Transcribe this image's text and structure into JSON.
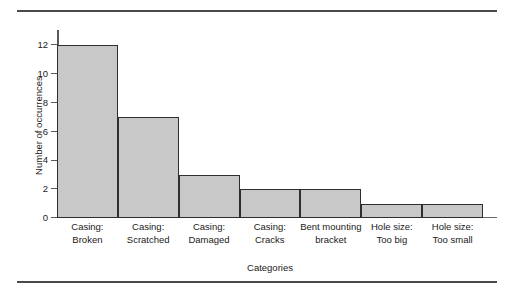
{
  "chart_data": {
    "type": "bar",
    "title": "",
    "subtitle": "",
    "xlabel": "Categories",
    "ylabel": "Number of occurrences",
    "categories": [
      "Casing: Broken",
      "Casing: Scratched",
      "Casing: Damaged",
      "Casing: Cracks",
      "Bent mounting bracket",
      "Hole size: Too big",
      "Hole size: Too small"
    ],
    "category_lines": [
      [
        "Casing:",
        "Broken"
      ],
      [
        "Casing:",
        "Scratched"
      ],
      [
        "Casing:",
        "Damaged"
      ],
      [
        "Casing:",
        "Cracks"
      ],
      [
        "Bent mounting",
        "bracket"
      ],
      [
        "Hole size:",
        "Too big"
      ],
      [
        "Hole size:",
        "Too small"
      ]
    ],
    "values": [
      12,
      7,
      3,
      2,
      2,
      1,
      1
    ],
    "ylim": [
      0,
      12
    ],
    "yticks": [
      0,
      2,
      4,
      6,
      8,
      10,
      12
    ],
    "ytick_labels": [
      "0",
      "2",
      "4",
      "6",
      "8",
      "10",
      "12"
    ],
    "grid": false,
    "legend": null,
    "bar_gap": 0,
    "colors": {
      "bar_fill": "#c8c8c8",
      "bar_edge": "#2e2e2e",
      "axis": "#5a5a5a",
      "rule": "#4a4a4a",
      "text": "#1a1a1a",
      "background": "#ffffff"
    }
  }
}
